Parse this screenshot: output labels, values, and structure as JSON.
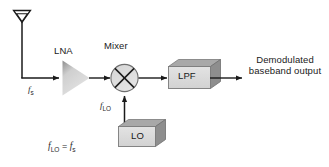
{
  "diagram": {
    "type": "block-diagram",
    "background_color": "#ffffff",
    "line_color": "#1a1a1a",
    "block_face_color": "#dcdcdc",
    "block_shade_color": "#9a9a9a",
    "blocks": [
      {
        "id": "antenna",
        "label": "",
        "shape": "antenna"
      },
      {
        "id": "lna",
        "label": "LNA",
        "shape": "triangle-amplifier"
      },
      {
        "id": "mixer",
        "label": "Mixer",
        "shape": "circle-with-x"
      },
      {
        "id": "lo",
        "label": "LO",
        "shape": "3d-box"
      },
      {
        "id": "lpf",
        "label": "LPF",
        "shape": "3d-box"
      }
    ],
    "signals": {
      "rf_input": "f",
      "rf_input_sub": "s",
      "lo_input": "f",
      "lo_input_sub": "LO"
    },
    "output_text": {
      "line1": "Demodulated",
      "line2": "baseband output"
    },
    "equation": {
      "lhs": "f",
      "lhs_sub": "LO",
      "operator": "=",
      "rhs": "f",
      "rhs_sub": "s"
    }
  }
}
